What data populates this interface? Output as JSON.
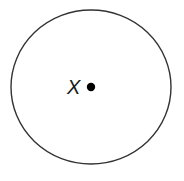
{
  "diagram": {
    "type": "circle-with-center-point",
    "circle": {
      "cx": 91,
      "cy": 87,
      "rx": 80,
      "ry": 77,
      "stroke": "#333333",
      "stroke_width": 1.4,
      "fill": "#ffffff"
    },
    "center_point": {
      "cx": 91,
      "cy": 87,
      "r": 4.2,
      "fill": "#000000"
    },
    "label": {
      "text": "X",
      "x": 67,
      "y": 94
    }
  }
}
